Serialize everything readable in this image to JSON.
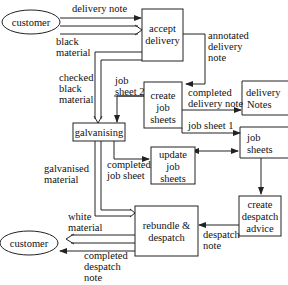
{
  "diagram": {
    "type": "data-flow diagram",
    "external_entities": [
      {
        "id": "customer_top",
        "label": "customer"
      },
      {
        "id": "customer_bottom",
        "label": "customer"
      }
    ],
    "processes": [
      {
        "id": "accept_delivery",
        "lines": [
          "accept",
          "delivery"
        ]
      },
      {
        "id": "create_job_sheets",
        "lines": [
          "create",
          "job",
          "sheets"
        ]
      },
      {
        "id": "galvanising",
        "lines": [
          "galvanising"
        ]
      },
      {
        "id": "update_job_sheets",
        "lines": [
          "update",
          "job",
          "sheets"
        ]
      },
      {
        "id": "rebundle_despatch",
        "lines": [
          "rebundle &",
          "despatch"
        ]
      },
      {
        "id": "create_despatch_advice",
        "lines": [
          "create",
          "despatch",
          "advice"
        ]
      }
    ],
    "stores": [
      {
        "id": "delivery_notes",
        "lines": [
          "delivery",
          "Notes"
        ]
      },
      {
        "id": "job_sheets_store",
        "lines": [
          "job",
          "sheets"
        ]
      }
    ],
    "flows": [
      {
        "from": "customer_top",
        "to": "accept_delivery",
        "lines": [
          "delivery note"
        ]
      },
      {
        "from": "customer_top",
        "to": "accept_delivery",
        "lines": [
          "black",
          "material"
        ]
      },
      {
        "from": "accept_delivery",
        "to": "create_job_sheets",
        "lines": [
          "annotated",
          "delivery",
          "note"
        ]
      },
      {
        "from": "accept_delivery",
        "to": "galvanising",
        "lines": [
          "checked",
          "black",
          "material"
        ]
      },
      {
        "from": "create_job_sheets",
        "to": "galvanising",
        "lines": [
          "job",
          "sheet 2"
        ]
      },
      {
        "from": "create_job_sheets",
        "to": "delivery_notes",
        "lines": [
          "completed",
          "delivery note"
        ]
      },
      {
        "from": "create_job_sheets",
        "to": "job_sheets_store",
        "lines": [
          "job sheet 1"
        ]
      },
      {
        "from": "galvanising",
        "to": "update_job_sheets",
        "lines": [
          "completed",
          "job sheet"
        ]
      },
      {
        "from": "galvanising",
        "to": "rebundle_despatch",
        "lines": [
          "galvanised",
          "material"
        ]
      },
      {
        "from": "update_job_sheets",
        "to": "job_sheets_store",
        "lines": []
      },
      {
        "from": "job_sheets_store",
        "to": "create_despatch_advice",
        "lines": []
      },
      {
        "from": "create_despatch_advice",
        "to": "rebundle_despatch",
        "lines": [
          "despatch",
          "note"
        ]
      },
      {
        "from": "rebundle_despatch",
        "to": "customer_bottom",
        "lines": [
          "white",
          "material"
        ]
      },
      {
        "from": "rebundle_despatch",
        "to": "customer_bottom",
        "lines": [
          "completed",
          "despatch",
          "note"
        ]
      }
    ]
  },
  "labels": {
    "customer_top": "customer",
    "customer_bottom": "customer",
    "accept_1": "accept",
    "accept_2": "delivery",
    "cjs_1": "create",
    "cjs_2": "job",
    "cjs_3": "sheets",
    "galv": "galvanising",
    "ujs_1": "update",
    "ujs_2": "job",
    "ujs_3": "sheets",
    "reb_1": "rebundle &",
    "reb_2": "despatch",
    "cda_1": "create",
    "cda_2": "despatch",
    "cda_3": "advice",
    "dn_1": "delivery",
    "dn_2": "Notes",
    "js_1": "job",
    "js_2": "sheets",
    "f_delivery_note": "delivery note",
    "f_black_1": "black",
    "f_black_2": "material",
    "f_annot_1": "annotated",
    "f_annot_2": "delivery",
    "f_annot_3": "note",
    "f_checked_1": "checked",
    "f_checked_2": "black",
    "f_checked_3": "material",
    "f_js2_1": "job",
    "f_js2_2": "sheet 2",
    "f_cdn_1": "completed",
    "f_cdn_2": "delivery note",
    "f_js1": "job sheet 1",
    "f_cjs_1": "completed",
    "f_cjs_2": "job sheet",
    "f_galv_1": "galvanised",
    "f_galv_2": "material",
    "f_white_1": "white",
    "f_white_2": "material",
    "f_cdesp_1": "completed",
    "f_cdesp_2": "despatch",
    "f_cdesp_3": "note",
    "f_desp_1": "despatch",
    "f_desp_2": "note"
  }
}
